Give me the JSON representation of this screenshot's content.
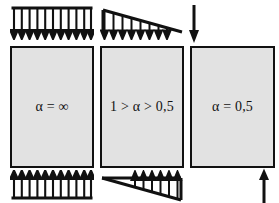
{
  "figure": {
    "background_color": "#ffffff",
    "block_fill_color": "#e2e2e2",
    "line_color": "#111111",
    "width": 279,
    "height": 203
  },
  "blocks": [
    {
      "id": "block-alpha-infinite",
      "label": "α = ∞",
      "x": 10,
      "y": 46,
      "width": 84,
      "height": 122,
      "top_load": {
        "type": "uniform",
        "direction": "down",
        "arrow_count": 11,
        "x": 10,
        "y": 6,
        "width": 84,
        "height": 34
      },
      "bottom_load": {
        "type": "uniform",
        "direction": "up",
        "arrow_count": 11,
        "x": 10,
        "y": 170,
        "width": 84,
        "height": 30
      }
    },
    {
      "id": "block-alpha-between",
      "label": "1 > α > 0,5",
      "x": 100,
      "y": 46,
      "width": 84,
      "height": 122,
      "top_load": {
        "type": "triangular",
        "direction": "down",
        "peak_side": "left",
        "arrow_count": 8,
        "x": 100,
        "y": 8,
        "width": 84,
        "height": 32
      },
      "bottom_load": {
        "type": "triangular",
        "direction": "up",
        "peak_side": "right",
        "arrow_count": 7,
        "x": 100,
        "y": 170,
        "width": 84,
        "height": 32
      }
    },
    {
      "id": "block-alpha-half",
      "label": "α = 0,5",
      "x": 190,
      "y": 46,
      "width": 85,
      "height": 122,
      "top_load": {
        "type": "point",
        "direction": "down",
        "arrow_count": 1,
        "x": 189,
        "y": 5,
        "height": 38
      },
      "bottom_load": {
        "type": "point",
        "direction": "up",
        "arrow_count": 1,
        "x": 259,
        "y": 170,
        "height": 32
      }
    }
  ]
}
